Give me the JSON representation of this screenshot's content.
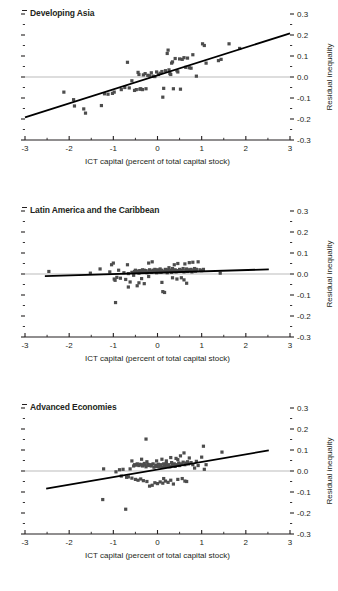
{
  "figure": {
    "panel_count": 3,
    "marker_color": "#4d4d4d",
    "trend_color": "#000000",
    "zeroline_color": "#b3b3b3",
    "axis_color": "#231f20"
  },
  "chart_data": [
    {
      "type": "scatter",
      "title": "Developing Asia",
      "xlabel": "ICT capital (percent of total capital stock)",
      "ylabel": "Residual inequality",
      "xlim": [
        -3,
        3
      ],
      "ylim": [
        -0.3,
        0.3
      ],
      "xticks": [
        -3,
        -2,
        -1,
        0,
        1,
        2,
        3
      ],
      "xticklabels": [
        "-3",
        "-2",
        "-1",
        "0",
        "1",
        "2",
        "3"
      ],
      "yticks": [
        -0.3,
        -0.2,
        -0.1,
        0.0,
        0.1,
        0.2,
        0.3
      ],
      "yticklabels": [
        "-0.3",
        "-0.2",
        "-0.1",
        "0.0",
        "0.1",
        "0.2",
        "0.3"
      ],
      "xminor_step": 0.5,
      "yminor_step": 0.05,
      "grid": false,
      "legend": "none",
      "zero_line": 0.0,
      "trendline": {
        "x0": -3.0,
        "y0": -0.192,
        "x1": 3.0,
        "y1": 0.208
      },
      "points": [
        [
          -2.12,
          -0.072
        ],
        [
          -1.9,
          -0.108
        ],
        [
          -1.88,
          -0.138
        ],
        [
          -1.67,
          -0.152
        ],
        [
          -1.63,
          -0.172
        ],
        [
          -1.27,
          -0.136
        ],
        [
          -1.2,
          -0.08
        ],
        [
          -1.12,
          -0.082
        ],
        [
          -1.02,
          -0.078
        ],
        [
          -0.98,
          -0.072
        ],
        [
          -0.82,
          -0.06
        ],
        [
          -0.74,
          -0.05
        ],
        [
          -0.68,
          0.07
        ],
        [
          -0.64,
          -0.052
        ],
        [
          -0.58,
          -0.018
        ],
        [
          -0.52,
          -0.064
        ],
        [
          -0.48,
          -0.06
        ],
        [
          -0.44,
          0.022
        ],
        [
          -0.42,
          0.012
        ],
        [
          -0.4,
          -0.058
        ],
        [
          -0.38,
          -0.056
        ],
        [
          -0.34,
          -0.06
        ],
        [
          -0.32,
          0.01
        ],
        [
          -0.28,
          0.016
        ],
        [
          -0.26,
          -0.056
        ],
        [
          -0.22,
          0.008
        ],
        [
          -0.18,
          0.006
        ],
        [
          -0.14,
          0.02
        ],
        [
          -0.1,
          0.004
        ],
        [
          -0.06,
          0.002
        ],
        [
          -0.02,
          0.024
        ],
        [
          0.02,
          0.012
        ],
        [
          0.06,
          0.018
        ],
        [
          0.1,
          0.026
        ],
        [
          0.12,
          -0.096
        ],
        [
          0.14,
          -0.054
        ],
        [
          0.18,
          0.03
        ],
        [
          0.22,
          0.112
        ],
        [
          0.24,
          0.128
        ],
        [
          0.26,
          0.034
        ],
        [
          0.28,
          0.016
        ],
        [
          0.3,
          0.012
        ],
        [
          0.32,
          0.066
        ],
        [
          0.34,
          0.072
        ],
        [
          0.36,
          -0.056
        ],
        [
          0.4,
          0.088
        ],
        [
          0.44,
          0.03
        ],
        [
          0.46,
          0.024
        ],
        [
          0.5,
          0.086
        ],
        [
          0.52,
          -0.058
        ],
        [
          0.56,
          0.084
        ],
        [
          0.6,
          0.092
        ],
        [
          0.64,
          0.046
        ],
        [
          0.68,
          0.09
        ],
        [
          0.72,
          0.044
        ],
        [
          0.76,
          0.042
        ],
        [
          0.8,
          0.106
        ],
        [
          0.88,
          0.004
        ],
        [
          1.02,
          0.158
        ],
        [
          1.06,
          0.15
        ],
        [
          1.1,
          0.066
        ],
        [
          1.38,
          0.078
        ],
        [
          1.44,
          0.084
        ],
        [
          1.62,
          0.158
        ],
        [
          1.86,
          0.136
        ]
      ]
    },
    {
      "type": "scatter",
      "title": "Latin America and the Caribbean",
      "xlabel": "ICT capital (percent of total capital stock)",
      "ylabel": "Residual inequality",
      "xlim": [
        -3,
        3
      ],
      "ylim": [
        -0.3,
        0.3
      ],
      "xticks": [
        -3,
        -2,
        -1,
        0,
        1,
        2,
        3
      ],
      "xticklabels": [
        "-3",
        "-2",
        "-1",
        "0",
        "1",
        "2",
        "3"
      ],
      "yticks": [
        -0.3,
        -0.2,
        -0.1,
        0.0,
        0.1,
        0.2,
        0.3
      ],
      "yticklabels": [
        "-0.3",
        "-0.2",
        "-0.1",
        "0.0",
        "0.1",
        "0.2",
        "0.3"
      ],
      "xminor_step": 0.5,
      "yminor_step": 0.05,
      "grid": false,
      "legend": "none",
      "zero_line": 0.0,
      "trendline": {
        "x0": -2.55,
        "y0": -0.01,
        "x1": 2.52,
        "y1": 0.022
      },
      "points": [
        [
          -2.46,
          0.012
        ],
        [
          -1.52,
          0.004
        ],
        [
          -1.3,
          0.024
        ],
        [
          -1.08,
          0.01
        ],
        [
          -1.04,
          0.044
        ],
        [
          -1.0,
          0.052
        ],
        [
          -0.98,
          -0.024
        ],
        [
          -0.96,
          -0.03
        ],
        [
          -0.95,
          -0.136
        ],
        [
          -0.92,
          -0.016
        ],
        [
          -0.88,
          0.018
        ],
        [
          -0.84,
          -0.02
        ],
        [
          -0.76,
          0.006
        ],
        [
          -0.72,
          -0.026
        ],
        [
          -0.68,
          0.044
        ],
        [
          -0.66,
          0.002
        ],
        [
          -0.62,
          -0.038
        ],
        [
          -0.58,
          0.008
        ],
        [
          -0.54,
          -0.006
        ],
        [
          -0.52,
          0.012
        ],
        [
          -0.5,
          0.018
        ],
        [
          -0.48,
          0.01
        ],
        [
          -0.46,
          -0.056
        ],
        [
          -0.44,
          0.014
        ],
        [
          -0.42,
          0.004
        ],
        [
          -0.4,
          0.016
        ],
        [
          -0.38,
          0.01
        ],
        [
          -0.36,
          -0.022
        ],
        [
          -0.34,
          0.02
        ],
        [
          -0.32,
          0.008
        ],
        [
          -0.3,
          0.018
        ],
        [
          -0.28,
          0.012
        ],
        [
          -0.26,
          0.016
        ],
        [
          -0.24,
          0.006
        ],
        [
          -0.22,
          0.01
        ],
        [
          -0.2,
          0.052
        ],
        [
          -0.18,
          0.02
        ],
        [
          -0.16,
          0.014
        ],
        [
          -0.14,
          0.008
        ],
        [
          -0.12,
          0.058
        ],
        [
          -0.1,
          0.018
        ],
        [
          -0.08,
          0.012
        ],
        [
          -0.06,
          0.022
        ],
        [
          -0.04,
          0.016
        ],
        [
          -0.02,
          0.006
        ],
        [
          0.0,
          0.02
        ],
        [
          0.02,
          0.01
        ],
        [
          0.04,
          0.014
        ],
        [
          0.06,
          0.024
        ],
        [
          0.08,
          0.008
        ],
        [
          0.1,
          0.018
        ],
        [
          0.12,
          -0.084
        ],
        [
          0.14,
          0.012
        ],
        [
          0.16,
          -0.088
        ],
        [
          0.18,
          0.022
        ],
        [
          0.2,
          0.016
        ],
        [
          0.22,
          0.006
        ],
        [
          0.24,
          0.02
        ],
        [
          0.26,
          0.03
        ],
        [
          0.28,
          0.012
        ],
        [
          0.3,
          0.018
        ],
        [
          0.32,
          0.008
        ],
        [
          0.34,
          0.026
        ],
        [
          0.36,
          0.014
        ],
        [
          0.38,
          0.044
        ],
        [
          0.4,
          0.02
        ],
        [
          0.42,
          0.01
        ],
        [
          0.44,
          0.016
        ],
        [
          0.46,
          0.05
        ],
        [
          0.48,
          0.012
        ],
        [
          0.5,
          0.022
        ],
        [
          0.52,
          0.018
        ],
        [
          0.54,
          -0.018
        ],
        [
          0.56,
          0.014
        ],
        [
          0.58,
          0.026
        ],
        [
          0.6,
          0.01
        ],
        [
          0.62,
          0.048
        ],
        [
          0.64,
          0.018
        ],
        [
          0.66,
          0.024
        ],
        [
          0.68,
          0.012
        ],
        [
          0.7,
          0.02
        ],
        [
          0.72,
          0.054
        ],
        [
          0.74,
          0.016
        ],
        [
          0.76,
          0.022
        ],
        [
          0.78,
          0.01
        ],
        [
          0.8,
          0.056
        ],
        [
          0.82,
          0.018
        ],
        [
          0.84,
          0.026
        ],
        [
          0.86,
          0.014
        ],
        [
          0.88,
          0.022
        ],
        [
          0.92,
          0.058
        ],
        [
          0.96,
          0.02
        ],
        [
          1.0,
          0.016
        ],
        [
          1.04,
          0.022
        ],
        [
          -0.3,
          -0.046
        ],
        [
          -0.2,
          -0.012
        ],
        [
          0.1,
          -0.04
        ],
        [
          0.44,
          -0.024
        ],
        [
          0.6,
          -0.028
        ],
        [
          0.66,
          -0.044
        ],
        [
          1.42,
          0.004
        ],
        [
          -0.66,
          -0.062
        ],
        [
          -0.42,
          -0.042
        ],
        [
          0.34,
          -0.018
        ]
      ]
    },
    {
      "type": "scatter",
      "title": "Advanced Economies",
      "xlabel": "ICT capital (percent of total capital stock)",
      "ylabel": "Residual inequality",
      "xlim": [
        -3,
        3
      ],
      "ylim": [
        -0.3,
        0.3
      ],
      "xticks": [
        -3,
        -2,
        -1,
        0,
        1,
        2,
        3
      ],
      "xticklabels": [
        "-3",
        "-2",
        "-1",
        "0",
        "1",
        "2",
        "3"
      ],
      "yticks": [
        -0.3,
        -0.2,
        -0.1,
        0.0,
        0.1,
        0.2,
        0.3
      ],
      "yticklabels": [
        "-0.3",
        "-0.2",
        "-0.1",
        "0.0",
        "0.1",
        "0.2",
        "0.3"
      ],
      "xminor_step": 0.5,
      "yminor_step": 0.05,
      "grid": false,
      "legend": "none",
      "zero_line": 0.0,
      "trendline": {
        "x0": -2.52,
        "y0": -0.084,
        "x1": 2.52,
        "y1": 0.098
      },
      "points": [
        [
          -1.24,
          -0.136
        ],
        [
          -1.22,
          0.01
        ],
        [
          -0.94,
          -0.004
        ],
        [
          -0.86,
          0.006
        ],
        [
          -0.82,
          -0.024
        ],
        [
          -0.78,
          0.008
        ],
        [
          -0.72,
          -0.182
        ],
        [
          -0.7,
          -0.03
        ],
        [
          -0.66,
          -0.028
        ],
        [
          -0.62,
          0.01
        ],
        [
          -0.58,
          -0.034
        ],
        [
          -0.54,
          0.024
        ],
        [
          -0.52,
          0.03
        ],
        [
          -0.5,
          -0.04
        ],
        [
          -0.48,
          0.028
        ],
        [
          -0.46,
          0.034
        ],
        [
          -0.44,
          -0.044
        ],
        [
          -0.42,
          0.026
        ],
        [
          -0.4,
          0.032
        ],
        [
          -0.38,
          -0.038
        ],
        [
          -0.36,
          0.03
        ],
        [
          -0.34,
          0.024
        ],
        [
          -0.32,
          -0.046
        ],
        [
          -0.3,
          0.036
        ],
        [
          -0.28,
          0.028
        ],
        [
          -0.26,
          0.152
        ],
        [
          -0.26,
          0.02
        ],
        [
          -0.24,
          -0.05
        ],
        [
          -0.22,
          0.032
        ],
        [
          -0.2,
          0.026
        ],
        [
          -0.18,
          -0.072
        ],
        [
          -0.16,
          0.03
        ],
        [
          -0.14,
          0.024
        ],
        [
          -0.12,
          -0.068
        ],
        [
          -0.1,
          0.034
        ],
        [
          -0.08,
          0.018
        ],
        [
          -0.06,
          -0.056
        ],
        [
          -0.04,
          0.028
        ],
        [
          -0.02,
          0.022
        ],
        [
          0.0,
          -0.06
        ],
        [
          0.02,
          0.032
        ],
        [
          0.04,
          0.02
        ],
        [
          0.06,
          -0.052
        ],
        [
          0.08,
          0.03
        ],
        [
          0.1,
          0.018
        ],
        [
          0.12,
          -0.058
        ],
        [
          0.14,
          0.034
        ],
        [
          0.16,
          0.022
        ],
        [
          0.18,
          -0.048
        ],
        [
          0.2,
          0.036
        ],
        [
          0.22,
          0.024
        ],
        [
          0.24,
          -0.054
        ],
        [
          0.26,
          0.03
        ],
        [
          0.28,
          0.02
        ],
        [
          0.3,
          -0.044
        ],
        [
          0.32,
          0.04
        ],
        [
          0.34,
          0.026
        ],
        [
          0.36,
          -0.062
        ],
        [
          0.38,
          0.034
        ],
        [
          0.4,
          0.022
        ],
        [
          0.42,
          0.06
        ],
        [
          0.44,
          0.03
        ],
        [
          0.46,
          -0.04
        ],
        [
          0.48,
          0.038
        ],
        [
          0.5,
          0.026
        ],
        [
          0.52,
          0.072
        ],
        [
          0.54,
          0.034
        ],
        [
          0.56,
          -0.036
        ],
        [
          0.58,
          0.042
        ],
        [
          0.6,
          0.086
        ],
        [
          0.62,
          0.03
        ],
        [
          0.64,
          0.038
        ],
        [
          0.66,
          -0.05
        ],
        [
          0.68,
          0.044
        ],
        [
          0.7,
          0.034
        ],
        [
          0.72,
          0.062
        ],
        [
          0.76,
          0.04
        ],
        [
          0.8,
          0.03
        ],
        [
          0.84,
          0.014
        ],
        [
          0.88,
          0.046
        ],
        [
          0.92,
          0.026
        ],
        [
          1.0,
          0.066
        ],
        [
          1.04,
          0.118
        ],
        [
          1.06,
          0.008
        ],
        [
          1.1,
          0.03
        ],
        [
          1.46,
          0.09
        ],
        [
          -0.58,
          0.048
        ],
        [
          0.1,
          0.056
        ],
        [
          0.3,
          0.064
        ],
        [
          -0.36,
          0.056
        ],
        [
          0.2,
          0.048
        ],
        [
          0.46,
          0.054
        ],
        [
          -0.24,
          0.044
        ],
        [
          0.62,
          -0.048
        ],
        [
          0.14,
          -0.036
        ],
        [
          -0.02,
          0.048
        ]
      ]
    }
  ]
}
